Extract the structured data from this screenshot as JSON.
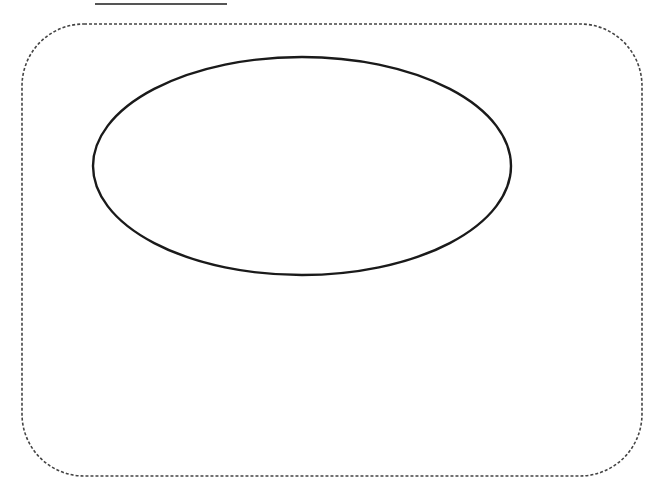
{
  "canvas": {
    "width": 667,
    "height": 500,
    "background": "#ffffff"
  },
  "shapes": {
    "top_line": {
      "x1": 95,
      "y1": 4,
      "x2": 227,
      "y2": 4,
      "stroke": "#555555",
      "stroke_width": 2
    },
    "frame": {
      "x": 22,
      "y": 24,
      "width": 620,
      "height": 452,
      "corner_radius": 62,
      "stroke": "#444444",
      "stroke_width": 1.6,
      "dash": "3 2"
    },
    "ellipse": {
      "cx": 302,
      "cy": 166,
      "rx": 209,
      "ry": 109,
      "stroke": "#1a1a1a",
      "stroke_width": 2.4,
      "fill": "none"
    }
  }
}
